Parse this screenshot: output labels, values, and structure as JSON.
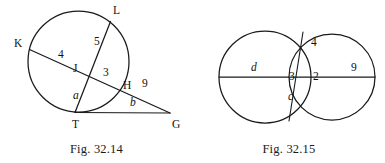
{
  "sheet": {
    "title": "Circle theorem figures 32.14 and 32.15",
    "background_color": "#ffffff",
    "ink_color": "#1a1a1a"
  },
  "figures": [
    {
      "id": "fig-32-14",
      "caption": "Fig. 32.14",
      "description": "Circle with two intersecting chords KH and LT, chord KH extended to external point G with tangent-like segment TG",
      "point_labels": [
        {
          "name": "K",
          "text": "K",
          "x": 14,
          "y": 47
        },
        {
          "name": "L",
          "text": "L",
          "x": 113,
          "y": 14
        },
        {
          "name": "J",
          "text": "J",
          "x": 73,
          "y": 72
        },
        {
          "name": "H",
          "text": "H",
          "x": 123,
          "y": 89
        },
        {
          "name": "T",
          "text": "T",
          "x": 72,
          "y": 128
        },
        {
          "name": "G",
          "text": "G",
          "x": 172,
          "y": 128
        }
      ],
      "segment_labels": [
        {
          "name": "KJ",
          "text": "4",
          "x": 58,
          "y": 58,
          "style": "number"
        },
        {
          "name": "JL",
          "text": "5",
          "x": 94,
          "y": 45,
          "style": "number"
        },
        {
          "name": "JH",
          "text": "3",
          "x": 103,
          "y": 76,
          "style": "number"
        },
        {
          "name": "HG",
          "text": "9",
          "x": 142,
          "y": 87,
          "style": "number"
        },
        {
          "name": "JT",
          "text": "a",
          "x": 73,
          "y": 99,
          "style": "variable"
        },
        {
          "name": "TG",
          "text": "b",
          "x": 130,
          "y": 106,
          "style": "variable"
        }
      ]
    },
    {
      "id": "fig-32-15",
      "caption": "Fig. 32.15",
      "description": "Two overlapping circles sharing a common horizontal secant line, with a chord through both intersection points of the circles",
      "point_labels": [],
      "segment_labels": [
        {
          "name": "left-chord-d",
          "text": "d",
          "x": 58,
          "y": 71,
          "style": "variable"
        },
        {
          "name": "upper-lens-4",
          "text": "4",
          "x": 118,
          "y": 46,
          "style": "number"
        },
        {
          "name": "left-lens-3",
          "text": "3",
          "x": 96,
          "y": 80,
          "style": "number"
        },
        {
          "name": "right-lens-2",
          "text": "2",
          "x": 120,
          "y": 80,
          "style": "number"
        },
        {
          "name": "lower-lens-c",
          "text": "c",
          "x": 95,
          "y": 100,
          "style": "variable"
        },
        {
          "name": "right-chord-9",
          "text": "9",
          "x": 158,
          "y": 71,
          "style": "number"
        }
      ]
    }
  ]
}
